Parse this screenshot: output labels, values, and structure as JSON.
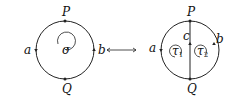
{
  "left_diagram": {
    "labels": {
      "top": "P",
      "bottom": "Q",
      "left": "a",
      "right": "b",
      "center": "σ"
    }
  },
  "arrow": {
    "symbol": "⟷"
  },
  "right_diagram": {
    "labels": {
      "top": "P",
      "bottom": "Q",
      "left": "a",
      "right": "b",
      "chord": "c",
      "face_left": "τ",
      "face_left_sub": "1",
      "face_right": "τ",
      "face_right_sub": "2"
    }
  }
}
